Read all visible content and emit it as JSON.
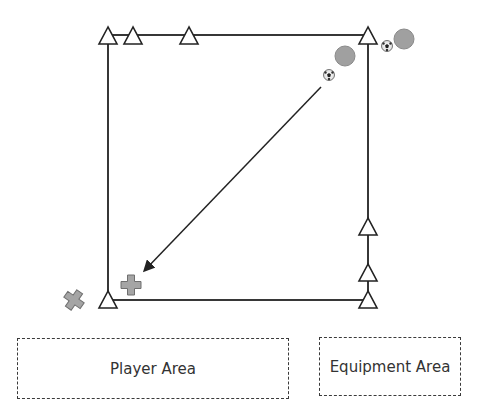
{
  "diagram": {
    "field": {
      "x1": 108,
      "y1": 35,
      "x2": 368,
      "y2": 300,
      "line_color": "#222222"
    },
    "cones": [
      {
        "x": 108,
        "y": 35
      },
      {
        "x": 133,
        "y": 35
      },
      {
        "x": 189,
        "y": 35
      },
      {
        "x": 368,
        "y": 35
      },
      {
        "x": 368,
        "y": 226
      },
      {
        "x": 368,
        "y": 273
      },
      {
        "x": 368,
        "y": 300
      },
      {
        "x": 108,
        "y": 300
      }
    ],
    "players_circle": [
      {
        "x": 345,
        "y": 56,
        "r": 10
      },
      {
        "x": 404,
        "y": 39,
        "r": 10
      }
    ],
    "balls": [
      {
        "x": 329,
        "y": 75
      },
      {
        "x": 387,
        "y": 46
      }
    ],
    "players_cross": [
      {
        "x": 131,
        "y": 285,
        "rotation": 0
      },
      {
        "x": 74,
        "y": 300,
        "rotation": 35
      }
    ],
    "pass_arrow": {
      "from": [
        321,
        87
      ],
      "to": [
        145,
        270
      ]
    },
    "colors": {
      "player_fill": "#a0a0a0",
      "player_stroke": "#8a8a8a",
      "cross_fill": "#a5a5a5",
      "cross_stroke": "#6f6f6f"
    }
  },
  "zones": {
    "player_area": "Player Area",
    "equipment_area": "Equipment Area"
  }
}
